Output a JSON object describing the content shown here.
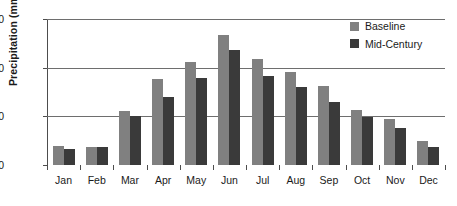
{
  "chart_data": {
    "type": "bar",
    "title": "",
    "xlabel": "",
    "ylabel": "Precipitation (mm)",
    "ylim": [
      0,
      150
    ],
    "yticks": [
      0,
      50,
      100,
      150
    ],
    "ytick_labels": [
      "0",
      "50",
      "100",
      "150"
    ],
    "grid": "horizontal",
    "legend_position": "top-right",
    "categories": [
      "Jan",
      "Feb",
      "Mar",
      "Apr",
      "May",
      "Jun",
      "Jul",
      "Aug",
      "Sep",
      "Oct",
      "Nov",
      "Dec"
    ],
    "series": [
      {
        "name": "Baseline",
        "color": "#808080",
        "values": [
          20,
          19,
          56,
          88,
          106,
          134,
          109,
          96,
          81,
          57,
          47,
          25
        ]
      },
      {
        "name": "Mid-Century",
        "color": "#3a3a3a",
        "values": [
          16,
          18,
          50,
          70,
          89,
          118,
          91,
          80,
          65,
          49,
          38,
          18
        ]
      }
    ]
  }
}
